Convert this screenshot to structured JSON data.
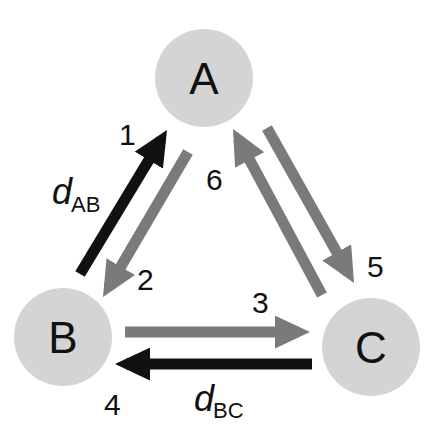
{
  "colors": {
    "node_fill": "#d4d4d4",
    "gray_arrow": "#7a7a7a",
    "black_arrow": "#111111",
    "text": "#111111"
  },
  "nodes": [
    {
      "id": "A",
      "label": "A",
      "cx": 204,
      "cy": 78,
      "r": 49
    },
    {
      "id": "B",
      "label": "B",
      "cx": 63,
      "cy": 337,
      "r": 49
    },
    {
      "id": "C",
      "label": "C",
      "cx": 371,
      "cy": 347,
      "r": 49
    }
  ],
  "arrows": [
    {
      "step": "1",
      "from": "B",
      "to": "A",
      "style": "black",
      "x1": 80,
      "y1": 274,
      "x2": 167,
      "y2": 130
    },
    {
      "step": "2",
      "from": "A",
      "to": "B",
      "style": "gray",
      "x1": 188,
      "y1": 152,
      "x2": 103,
      "y2": 297
    },
    {
      "step": "3",
      "from": "B",
      "to": "C",
      "style": "gray",
      "x1": 125,
      "y1": 332,
      "x2": 310,
      "y2": 332
    },
    {
      "step": "4",
      "from": "C",
      "to": "B",
      "style": "black",
      "x1": 312,
      "y1": 364,
      "x2": 115,
      "y2": 364
    },
    {
      "step": "5",
      "from": "A",
      "to": "C",
      "style": "gray",
      "x1": 267,
      "y1": 128,
      "x2": 354,
      "y2": 283
    },
    {
      "step": "6",
      "from": "C",
      "to": "A",
      "style": "gray",
      "x1": 322,
      "y1": 295,
      "x2": 233,
      "y2": 129
    }
  ],
  "step_labels": [
    {
      "text": "1",
      "x": 119,
      "y": 145
    },
    {
      "text": "2",
      "x": 137,
      "y": 290
    },
    {
      "text": "3",
      "x": 252,
      "y": 313
    },
    {
      "text": "4",
      "x": 104,
      "y": 415
    },
    {
      "text": "5",
      "x": 367,
      "y": 277
    },
    {
      "text": "6",
      "x": 206,
      "y": 190
    }
  ],
  "distance_labels": [
    {
      "var": "d",
      "sub": "AB",
      "x": 52,
      "y": 204,
      "sub_x": 71,
      "sub_y": 212
    },
    {
      "var": "d",
      "sub": "BC",
      "x": 194,
      "y": 411,
      "sub_x": 213,
      "sub_y": 418
    }
  ]
}
